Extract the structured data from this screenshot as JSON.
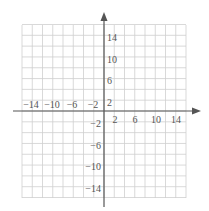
{
  "chart_data": {
    "type": "line",
    "title": "",
    "xlabel": "",
    "ylabel": "",
    "xlim": [
      -16,
      16
    ],
    "ylim": [
      -16,
      16
    ],
    "grid": true,
    "grid_step": 2,
    "x_tick_labels": [
      "-14",
      "-10",
      "-6",
      "-2",
      "2",
      "6",
      "10",
      "14"
    ],
    "x_tick_values": [
      -14,
      -10,
      -6,
      -2,
      2,
      6,
      10,
      14
    ],
    "y_tick_labels": [
      "14",
      "10",
      "6",
      "2",
      "-2",
      "-6",
      "-10",
      "-14"
    ],
    "y_tick_values": [
      14,
      10,
      6,
      2,
      -2,
      -6,
      -10,
      -14
    ],
    "series": [],
    "axes": {
      "x_arrow": "right",
      "y_arrow": "up"
    },
    "legend": null
  },
  "colors": {
    "grid": "#cfcfcf",
    "axis": "#555555",
    "text": "#555555",
    "background": "#ffffff"
  },
  "labels": {
    "x_neg14": "−14",
    "x_neg10": "−10",
    "x_neg6": "−6",
    "x_neg2": "−2",
    "x_2": "2",
    "x_6": "6",
    "x_10": "10",
    "x_14": "14",
    "y_14": "14",
    "y_10": "10",
    "y_6": "6",
    "y_2": "2",
    "y_neg2": "−2",
    "y_neg6": "−6",
    "y_neg10": "−10",
    "y_neg14": "−14"
  }
}
